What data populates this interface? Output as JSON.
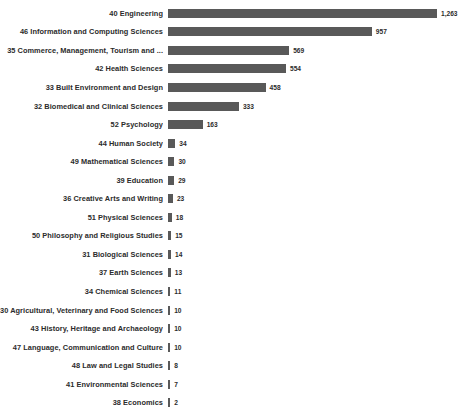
{
  "chart_data": {
    "type": "bar",
    "orientation": "horizontal",
    "title": "",
    "xlabel": "",
    "ylabel": "",
    "grid": false,
    "legend": false,
    "axis_visible": false,
    "data_labels": true,
    "bar_color": "#595959",
    "background_color": "#ffffff",
    "xlim": [
      0,
      1263
    ],
    "categories": [
      "40 Engineering",
      "46 Information and Computing Sciences",
      "35 Commerce, Management, Tourism and ...",
      "42 Health Sciences",
      "33 Built Environment and Design",
      "32 Biomedical and Clinical Sciences",
      "52 Psychology",
      "44 Human Society",
      "49 Mathematical Sciences",
      "39 Education",
      "36 Creative Arts and Writing",
      "51 Physical Sciences",
      "50 Philosophy and Religious Studies",
      "31 Biological Sciences",
      "37 Earth Sciences",
      "34 Chemical Sciences",
      "30 Agricultural, Veterinary and Food Sciences",
      "43 History, Heritage and Archaeology",
      "47 Language, Communication and Culture",
      "48 Law and Legal Studies",
      "41 Environmental Sciences",
      "38 Economics"
    ],
    "values": [
      1263,
      957,
      569,
      554,
      458,
      333,
      163,
      34,
      30,
      29,
      23,
      18,
      15,
      14,
      13,
      11,
      10,
      10,
      10,
      8,
      7,
      2
    ],
    "value_labels": [
      "1,263",
      "957",
      "569",
      "554",
      "458",
      "333",
      "163",
      "34",
      "30",
      "29",
      "23",
      "18",
      "15",
      "14",
      "13",
      "11",
      "10",
      "10",
      "10",
      "8",
      "7",
      "2"
    ]
  }
}
